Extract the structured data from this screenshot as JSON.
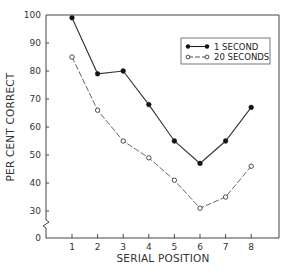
{
  "chart_data": {
    "type": "line",
    "title": "",
    "xlabel": "SERIAL POSITION",
    "ylabel": "PER CENT CORRECT",
    "x": [
      1,
      2,
      3,
      4,
      5,
      6,
      7,
      8
    ],
    "x_tick_labels": [
      "1",
      "2",
      "3",
      "4",
      "5",
      "6",
      "7",
      "8"
    ],
    "y_tick_labels": [
      "0",
      "30",
      "40",
      "50",
      "60",
      "70",
      "80",
      "90",
      "100"
    ],
    "y_ticks": [
      0,
      30,
      40,
      50,
      60,
      70,
      80,
      90,
      100
    ],
    "ylim": [
      0,
      100
    ],
    "y_axis_break": "between 0 and 30",
    "grid": false,
    "legend_position": "upper right",
    "series": [
      {
        "name": "1 SECOND",
        "marker": "filled-circle",
        "line": "solid",
        "values": [
          99,
          79,
          80,
          68,
          55,
          47,
          55,
          67
        ]
      },
      {
        "name": "20 SECONDS",
        "marker": "open-circle",
        "line": "dashed",
        "values": [
          85,
          66,
          55,
          49,
          41,
          31,
          35,
          46
        ]
      }
    ]
  },
  "legend": {
    "items": [
      {
        "label": "1 SECOND"
      },
      {
        "label": "20 SECONDS"
      }
    ]
  }
}
